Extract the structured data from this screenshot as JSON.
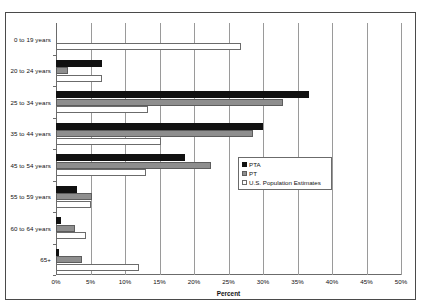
{
  "chart_data": {
    "type": "bar",
    "orientation": "horizontal",
    "title": "",
    "xlabel": "Percent",
    "ylabel": "",
    "xlim": [
      0,
      50
    ],
    "xticks": [
      "0%",
      "5%",
      "10%",
      "15%",
      "20%",
      "25%",
      "30%",
      "35%",
      "40%",
      "45%",
      "50%"
    ],
    "xtick_values": [
      0,
      5,
      10,
      15,
      20,
      25,
      30,
      35,
      40,
      45,
      50
    ],
    "grid": "vertical",
    "legend_position": "center-right",
    "categories": [
      "0 to 19 years",
      "20 to 24 years",
      "25 to 34 years",
      "35 to 44 years",
      "45 to 54 years",
      "55 to 59 years",
      "60 to 64 years",
      "65+"
    ],
    "series": [
      {
        "name": "PTA",
        "color": "#111111",
        "values": [
          0.0,
          6.7,
          36.6,
          30.0,
          18.7,
          3.1,
          0.7,
          0.4
        ]
      },
      {
        "name": "PT",
        "color": "#8e8e8e",
        "values": [
          0.0,
          1.7,
          32.9,
          28.5,
          22.4,
          5.2,
          2.7,
          3.7
        ]
      },
      {
        "name": "U.S. Population Estimates",
        "color": "#ffffff",
        "values": [
          26.8,
          6.7,
          13.4,
          15.2,
          13.0,
          5.0,
          4.3,
          12.1
        ]
      }
    ]
  },
  "legend": {
    "items": [
      {
        "label": "PTA",
        "swatch": "pta"
      },
      {
        "label": "PT",
        "swatch": "pt"
      },
      {
        "label": "U.S. Population Estimates",
        "swatch": "pop"
      }
    ]
  }
}
